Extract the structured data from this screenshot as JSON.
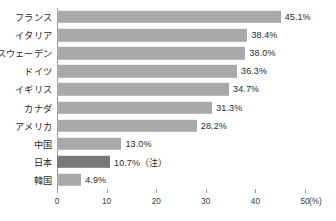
{
  "chart_data": {
    "type": "bar",
    "orientation": "horizontal",
    "title": "",
    "xlabel": "(%)",
    "ylabel": "",
    "xlim": [
      0,
      50
    ],
    "xticks": [
      0,
      10,
      20,
      30,
      40,
      50
    ],
    "xtick_labels": [
      "0",
      "10",
      "20",
      "30",
      "40",
      "50"
    ],
    "grid": false,
    "legend": "none",
    "categories": [
      "フランス",
      "イタリア",
      "スウェーデン",
      "ドイツ",
      "イギリス",
      "カナダ",
      "アメリカ",
      "中国",
      "日本",
      "韓国"
    ],
    "values": [
      45.1,
      38.4,
      38.0,
      36.3,
      34.7,
      31.3,
      28.2,
      13.0,
      10.7,
      4.9
    ],
    "data_labels": [
      "45.1%",
      "38.4%",
      "38.0%",
      "36.3%",
      "34.7%",
      "31.3%",
      "28.2%",
      "13.0%",
      "10.7%（注）",
      "4.9%"
    ],
    "highlight_index": 8,
    "colors": {
      "bar": "#a9a9a9",
      "bar_highlight": "#787878",
      "axis": "#9a9a9a",
      "text": "#2b2b2b"
    }
  }
}
